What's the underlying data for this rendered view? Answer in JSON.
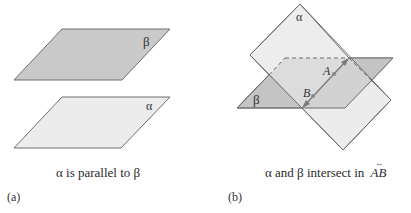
{
  "figure_a": {
    "top_plane_label": "β",
    "bottom_plane_label": "α",
    "caption": "α is parallel to β",
    "tag": "(a)"
  },
  "figure_b": {
    "alpha_label": "α",
    "beta_label": "β",
    "point_a_label": "A",
    "point_b_label": "B",
    "caption_text": "α and β intersect in",
    "caption_line": "AB",
    "caption_line_arrow": "↔",
    "tag": "(b)"
  },
  "colors": {
    "beta_fill": "#c9c9c9",
    "alpha_fill": "#ececec",
    "edge": "#6e6e6e",
    "line_ab": "#7a7a7a"
  }
}
